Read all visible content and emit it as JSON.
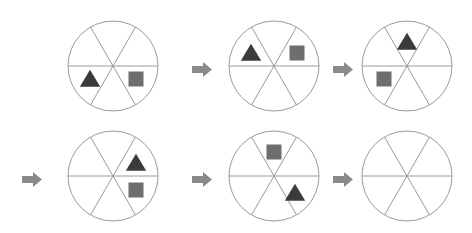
{
  "puzzle": {
    "type": "sequence-rotation-puzzle",
    "description": "Six-sector circle sequence; shapes rotate counterclockwise one sector per step; final circle is blank (answer slot)",
    "rows": 2,
    "columns": 3,
    "sector_count": 6,
    "sector_labels": [
      "upper-right",
      "right",
      "lower-right",
      "lower-left",
      "left",
      "upper-left"
    ],
    "colors": {
      "circle_stroke": "#9a9a9a",
      "spoke_stroke": "#9a9a9a",
      "triangle_fill": "#3b3b3b",
      "square_fill": "#6e6e6e",
      "arrow_fill": "#8a8a8a",
      "background": "#ffffff"
    },
    "geometry": {
      "circle_radius": 45,
      "stroke_width": 1,
      "triangle_size": 17,
      "square_size": 15,
      "shape_orbit_radius": 27
    },
    "icons": {
      "arrow": "right-arrow-icon",
      "triangle": "triangle-icon",
      "square": "square-icon",
      "circle": "sector-circle-icon"
    }
  },
  "circles": [
    {
      "id": 1,
      "name": "circle-step-1",
      "cx": 113,
      "cy": 66,
      "row": 1,
      "position_in_row": 1,
      "is_answer_slot": false,
      "shapes": [
        {
          "type": "triangle",
          "sector": 3,
          "sector_label": "lower-left",
          "angle_deg": 150,
          "x": 90,
          "y": 79
        },
        {
          "type": "square",
          "sector": 2,
          "sector_label": "lower-right",
          "angle_deg": 30,
          "x": 136,
          "y": 79
        }
      ]
    },
    {
      "id": 2,
      "name": "circle-step-2",
      "cx": 274,
      "cy": 66,
      "row": 1,
      "position_in_row": 2,
      "is_answer_slot": false,
      "shapes": [
        {
          "type": "triangle",
          "sector": 5,
          "sector_label": "upper-left",
          "angle_deg": 210,
          "x": 251,
          "y": 53
        },
        {
          "type": "square",
          "sector": 0,
          "sector_label": "upper-right",
          "angle_deg": 330,
          "x": 297,
          "y": 53
        }
      ]
    },
    {
      "id": 3,
      "name": "circle-step-3",
      "cx": 407,
      "cy": 66,
      "row": 1,
      "position_in_row": 3,
      "is_answer_slot": false,
      "shapes": [
        {
          "type": "triangle",
          "sector": 0,
          "sector_label": "upper-right",
          "angle_deg": 270,
          "x": 407,
          "y": 42
        },
        {
          "type": "square",
          "sector": 4,
          "sector_label": "left",
          "angle_deg": 150,
          "x": 384,
          "y": 79
        }
      ]
    },
    {
      "id": 4,
      "name": "circle-step-4",
      "cx": 113,
      "cy": 176,
      "row": 2,
      "position_in_row": 1,
      "is_answer_slot": false,
      "shapes": [
        {
          "type": "triangle",
          "sector": 0,
          "sector_label": "upper-right",
          "angle_deg": 330,
          "x": 136,
          "y": 163
        },
        {
          "type": "square",
          "sector": 1,
          "sector_label": "right",
          "angle_deg": 30,
          "x": 136,
          "y": 190
        }
      ]
    },
    {
      "id": 5,
      "name": "circle-step-5",
      "cx": 274,
      "cy": 176,
      "row": 2,
      "position_in_row": 2,
      "is_answer_slot": false,
      "shapes": [
        {
          "type": "square",
          "sector": 0,
          "sector_label": "top",
          "angle_deg": 270,
          "x": 274,
          "y": 152
        },
        {
          "type": "triangle",
          "sector": 2,
          "sector_label": "lower-right",
          "angle_deg": 40,
          "x": 295,
          "y": 193
        }
      ]
    },
    {
      "id": 6,
      "name": "circle-answer-slot",
      "cx": 407,
      "cy": 176,
      "row": 2,
      "position_in_row": 3,
      "is_answer_slot": true,
      "shapes": []
    }
  ],
  "arrows": [
    {
      "id": 1,
      "name": "arrow-step-1-to-2",
      "x": 192,
      "y": 62,
      "row": 1
    },
    {
      "id": 2,
      "name": "arrow-step-2-to-3",
      "x": 333,
      "y": 62,
      "row": 1
    },
    {
      "id": 3,
      "name": "arrow-row-wrap",
      "x": 22,
      "y": 172,
      "row": 2
    },
    {
      "id": 4,
      "name": "arrow-step-4-to-5",
      "x": 192,
      "y": 172,
      "row": 2
    },
    {
      "id": 5,
      "name": "arrow-step-5-to-6",
      "x": 333,
      "y": 172,
      "row": 2
    }
  ]
}
